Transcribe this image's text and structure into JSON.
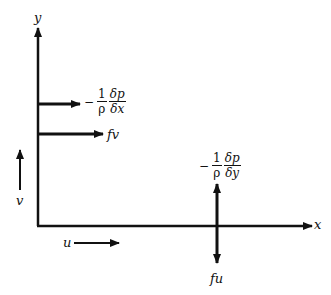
{
  "diagram": {
    "axes": {
      "x_label": "x",
      "y_label": "y"
    },
    "velocity_labels": {
      "u": "u",
      "v": "v"
    },
    "forces": {
      "pressure_x": {
        "sign": "−",
        "coef_num": "1",
        "coef_den": "ρ",
        "num": "δp",
        "den": "δx"
      },
      "coriolis_v": "fv",
      "pressure_y": {
        "sign": "−",
        "coef_num": "1",
        "coef_den": "ρ",
        "num": "δp",
        "den": "δy"
      },
      "coriolis_u": "fu"
    },
    "colors": {
      "ink": "#111111",
      "background": "#ffffff"
    }
  }
}
